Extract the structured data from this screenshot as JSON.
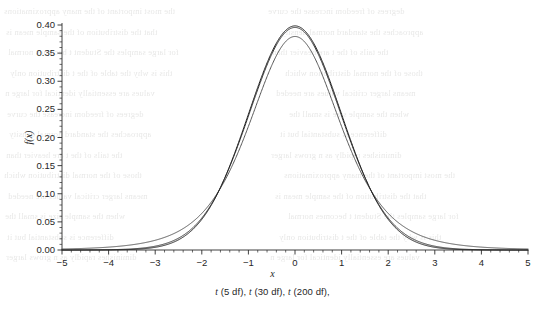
{
  "chart_data": {
    "type": "line",
    "title": "",
    "subtitle": "",
    "xlabel": "x",
    "ylabel": "f(x)",
    "caption": "t (5 df), t (30 df), t (200 df),",
    "xlim": [
      -5,
      5
    ],
    "ylim": [
      0.0,
      0.4
    ],
    "xticks": [
      "−5",
      "−4",
      "−3",
      "−2",
      "−1",
      "0",
      "1",
      "2",
      "3",
      "4",
      "5"
    ],
    "xtick_values": [
      -5,
      -4,
      -3,
      -2,
      -1,
      0,
      1,
      2,
      3,
      4,
      5
    ],
    "yticks": [
      "0.00",
      "0.05",
      "0.10",
      "0.15",
      "0.20",
      "0.25",
      "0.30",
      "0.35",
      "0.40"
    ],
    "ytick_values": [
      0.0,
      0.05,
      0.1,
      0.15,
      0.2,
      0.25,
      0.3,
      0.35,
      0.4
    ],
    "minor_ticks_per_interval": 5,
    "grid": false,
    "legend": "none",
    "axis_style": "left-and-bottom-spines-with-outward-ticks",
    "series": [
      {
        "name": "t (5 df)",
        "df": 5,
        "color": "#555555",
        "peak_value": 0.3796,
        "x": [
          -5,
          -4.5,
          -4,
          -3.5,
          -3,
          -2.5,
          -2,
          -1.5,
          -1,
          -0.5,
          0,
          0.5,
          1,
          1.5,
          2,
          2.5,
          3,
          3.5,
          4,
          4.5,
          5
        ],
        "values": [
          0.0017,
          0.0028,
          0.0051,
          0.0097,
          0.0192,
          0.038,
          0.0651,
          0.1245,
          0.2197,
          0.3279,
          0.3796,
          0.3279,
          0.2197,
          0.1245,
          0.0651,
          0.038,
          0.0192,
          0.0097,
          0.0051,
          0.0028,
          0.0017
        ]
      },
      {
        "name": "t (30 df)",
        "df": 30,
        "color": "#3a3a3a",
        "peak_value": 0.3956,
        "x": [
          -5,
          -4.5,
          -4,
          -3.5,
          -3,
          -2.5,
          -2,
          -1.5,
          -1,
          -0.5,
          0,
          0.5,
          1,
          1.5,
          2,
          2.5,
          3,
          3.5,
          4,
          4.5,
          5
        ],
        "values": [
          8e-05,
          0.0002,
          0.00051,
          0.00135,
          0.0036,
          0.00955,
          0.02476,
          0.06032,
          0.13049,
          0.23998,
          0.39564,
          0.23998,
          0.13049,
          0.06032,
          0.02476,
          0.00955,
          0.0036,
          0.00135,
          0.00051,
          0.0002,
          8e-05
        ]
      },
      {
        "name": "t (200 df)",
        "df": 200,
        "color": "#222222",
        "peak_value": 0.3981,
        "x": [
          -5,
          -4.5,
          -4,
          -3.5,
          -3,
          -2.5,
          -2,
          -1.5,
          -1,
          -0.5,
          0,
          0.5,
          1,
          1.5,
          2,
          2.5,
          3,
          3.5,
          4,
          4.5,
          5
        ],
        "values": [
          1e-05,
          3e-05,
          0.00014,
          0.00048,
          0.00154,
          0.005,
          0.01668,
          0.05273,
          0.12408,
          0.23683,
          0.39805,
          0.23683,
          0.12408,
          0.05273,
          0.01668,
          0.005,
          0.00154,
          0.00048,
          0.00014,
          3e-05,
          1e-05
        ]
      }
    ]
  },
  "ghost_text": {
    "note": "faint mirrored bleed-through text from the reverse side of the scanned page",
    "lines": [
      "the most important of the many approximations",
      "that the distribution of the sample mean is",
      "for large samples the Student t becomes normal",
      "this is why the table of the t distribution only",
      "values are essentially identical for large n",
      "degrees of freedom increase the curve",
      "approaches the standard normal density",
      "the tails of the t are heavier than",
      "those of the normal distribution which",
      "means larger critical values are needed",
      "when the sample size is small the",
      "difference is substantial but it",
      "diminishes rapidly as n grows larger"
    ]
  }
}
